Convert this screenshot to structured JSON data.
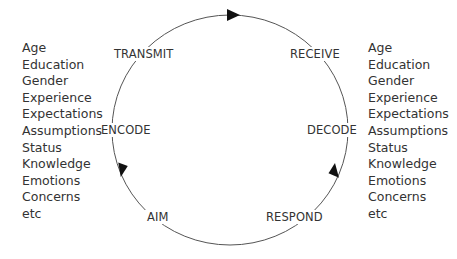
{
  "diagram": {
    "type": "communication-cycle",
    "nodes": [
      {
        "id": "transmit",
        "label": "TRANSMIT"
      },
      {
        "id": "receive",
        "label": "RECEIVE"
      },
      {
        "id": "decode",
        "label": "DECODE"
      },
      {
        "id": "respond",
        "label": "RESPOND"
      },
      {
        "id": "aim",
        "label": "AIM"
      },
      {
        "id": "encode",
        "label": "ENCODE"
      }
    ],
    "flow_direction": "clockwise",
    "left_factors": [
      "Age",
      "Education",
      "Gender",
      "Experience",
      "Expectations",
      "Assumptions",
      "Status",
      "Knowledge",
      "Emotions",
      "Concerns",
      "etc"
    ],
    "right_factors": [
      "Age",
      "Education",
      "Gender",
      "Experience",
      "Expectations",
      "Assumptions",
      "Status",
      "Knowledge",
      "Emotions",
      "Concerns",
      "etc"
    ],
    "colors": {
      "line": "#555555",
      "arrow": "#111111",
      "text": "#333333"
    }
  }
}
